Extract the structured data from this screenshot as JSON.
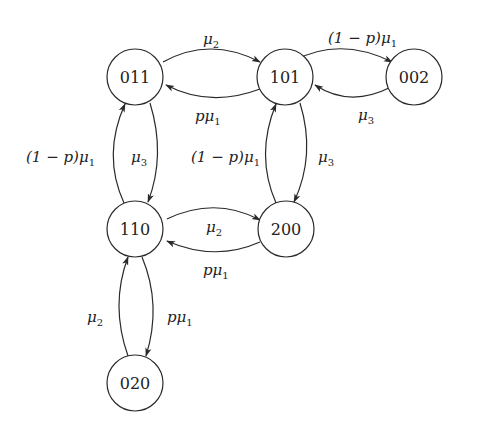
{
  "diagram": {
    "type": "state-transition-diagram",
    "nodes": [
      {
        "id": "011",
        "label": "011",
        "cx": 135,
        "cy": 77
      },
      {
        "id": "101",
        "label": "101",
        "cx": 285,
        "cy": 77
      },
      {
        "id": "002",
        "label": "002",
        "cx": 414,
        "cy": 77
      },
      {
        "id": "110",
        "label": "110",
        "cx": 135,
        "cy": 229
      },
      {
        "id": "200",
        "label": "200",
        "cx": 286,
        "cy": 229
      },
      {
        "id": "020",
        "label": "020",
        "cx": 135,
        "cy": 383
      }
    ],
    "node_radius": 28,
    "edges": [
      {
        "from": "011",
        "to": "101",
        "label": "μ2",
        "label_parts": [
          "μ",
          "2"
        ]
      },
      {
        "from": "101",
        "to": "011",
        "label": "pμ1",
        "label_parts": [
          "pμ",
          "1"
        ]
      },
      {
        "from": "101",
        "to": "002",
        "label": "(1 − p)μ1",
        "label_parts": [
          "(1 − p)μ",
          "1"
        ]
      },
      {
        "from": "002",
        "to": "101",
        "label": "μ3",
        "label_parts": [
          "μ",
          "3"
        ]
      },
      {
        "from": "110",
        "to": "011",
        "label": "(1 − p)μ1",
        "label_parts": [
          "(1 − p)μ",
          "1"
        ]
      },
      {
        "from": "011",
        "to": "110",
        "label": "μ3",
        "label_parts": [
          "μ",
          "3"
        ]
      },
      {
        "from": "200",
        "to": "101",
        "label": "(1 − p)μ1",
        "label_parts": [
          "(1 − p)μ",
          "1"
        ]
      },
      {
        "from": "101",
        "to": "200",
        "label": "μ3",
        "label_parts": [
          "μ",
          "3"
        ]
      },
      {
        "from": "110",
        "to": "200",
        "label": "μ2",
        "label_parts": [
          "μ",
          "2"
        ]
      },
      {
        "from": "200",
        "to": "110",
        "label": "pμ1",
        "label_parts": [
          "pμ",
          "1"
        ]
      },
      {
        "from": "020",
        "to": "110",
        "label": "μ2",
        "label_parts": [
          "μ",
          "2"
        ]
      },
      {
        "from": "110",
        "to": "020",
        "label": "pμ1",
        "label_parts": [
          "pμ",
          "1"
        ]
      }
    ]
  },
  "labels": {
    "n011": "011",
    "n101": "101",
    "n002": "002",
    "n110": "110",
    "n200": "200",
    "n020": "020",
    "e_011_101": {
      "main": "μ",
      "sub": "2"
    },
    "e_101_011": {
      "main": "pμ",
      "sub": "1"
    },
    "e_101_002": {
      "main": "(1 − p)μ",
      "sub": "1"
    },
    "e_002_101": {
      "main": "μ",
      "sub": "3"
    },
    "e_110_011": {
      "main": "(1 − p)μ",
      "sub": "1"
    },
    "e_011_110": {
      "main": "μ",
      "sub": "3"
    },
    "e_200_101": {
      "main": "(1 − p)μ",
      "sub": "1"
    },
    "e_101_200": {
      "main": "μ",
      "sub": "3"
    },
    "e_110_200": {
      "main": "μ",
      "sub": "2"
    },
    "e_200_110": {
      "main": "pμ",
      "sub": "1"
    },
    "e_020_110": {
      "main": "μ",
      "sub": "2"
    },
    "e_110_020": {
      "main": "pμ",
      "sub": "1"
    }
  },
  "colors": {
    "stroke": "#2a2a2a",
    "text": "#222222",
    "background": "#ffffff"
  }
}
